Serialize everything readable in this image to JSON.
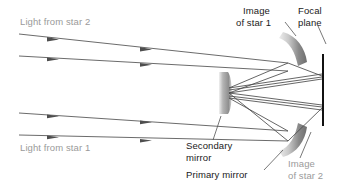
{
  "figure": {
    "kind": "optics-ray-diagram",
    "background_color": "#ffffff"
  },
  "colors": {
    "ray_line": "#5a5a5a",
    "reflected_ray": "#4a4a4a",
    "label_dark": "#1a1a1a",
    "label_gray": "#9a9a9a",
    "focal_plane_line": "#111111",
    "mirror_dark": "#6e6e6e",
    "mirror_light": "#ededed",
    "leader_line": "#555555"
  },
  "labels": {
    "light_from_star_2": "Light from star 2",
    "light_from_star_1": "Light from star 1",
    "image_of_star_1_line1": "Image",
    "image_of_star_1_line2": "of star 1",
    "focal_plane_line1": "Focal",
    "focal_plane_line2": "plane",
    "secondary_mirror_line1": "Secondary",
    "secondary_mirror_line2": "mirror",
    "primary_mirror": "Primary mirror",
    "image_of_star_2_line1": "Image",
    "image_of_star_2_line2": "of star 2"
  },
  "components": {
    "primary_mirror_upper": "upper primary mirror segment",
    "primary_mirror_lower": "lower primary mirror segment",
    "secondary_mirror": "secondary mirror",
    "focal_plane": "focal plane"
  },
  "rays": {
    "star2_incoming_count": 2,
    "star1_incoming_count": 2,
    "arrowheads_per_ray": 2
  }
}
